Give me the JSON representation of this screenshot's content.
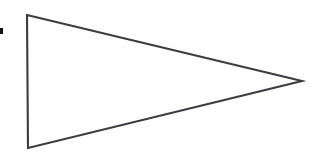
{
  "figure": {
    "background_color": "#ffffff",
    "stroke_color": "#3b3b42",
    "fill_color": "#ffffff",
    "stroke_width": 2.1,
    "canvas": {
      "width": 309,
      "height": 164
    },
    "shape": {
      "name": "triangle",
      "kind": "polygon",
      "orientation": "pointing-right",
      "vertex_count": 3,
      "points": "27,15 302,81 28,148",
      "vertices": [
        {
          "label": "top-left",
          "x": 27,
          "y": 15
        },
        {
          "label": "right-apex",
          "x": 302,
          "y": 81
        },
        {
          "label": "bottom-left",
          "x": 28,
          "y": 148
        }
      ],
      "edges": [
        {
          "label": "upper-edge",
          "from": "top-left",
          "to": "right-apex"
        },
        {
          "label": "lower-edge",
          "from": "right-apex",
          "to": "bottom-left"
        },
        {
          "label": "left-edge",
          "from": "bottom-left",
          "to": "top-left"
        }
      ]
    },
    "marks": [
      {
        "name": "left-edge-square-mark",
        "kind": "rect",
        "color": "#111111",
        "x": 0,
        "y": 28,
        "width": 3,
        "height": 6
      }
    ]
  }
}
